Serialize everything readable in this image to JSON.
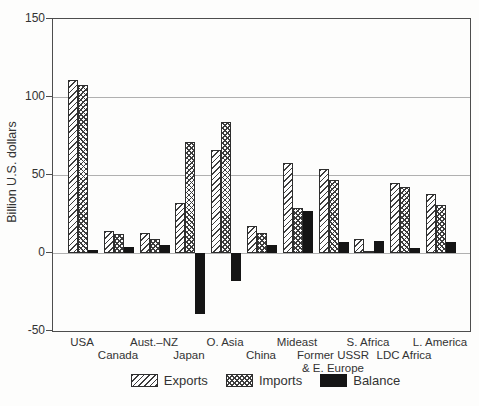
{
  "chart_data": {
    "type": "bar",
    "title": "",
    "ylabel": "Billion U.S. dollars",
    "xlabel": "",
    "ylim": [
      -50,
      150
    ],
    "yticks": [
      150,
      100,
      50,
      0,
      -50
    ],
    "gridline_values": [
      100,
      50,
      0
    ],
    "grid": "on",
    "legend_position": "bottom-center",
    "categories": [
      "USA",
      "Canada",
      "Aust.–NZ",
      "Japan",
      "O. Asia",
      "China",
      "Mideast",
      "Former USSR & E. Europe",
      "S. Africa",
      "LDC Africa",
      "L. America"
    ],
    "category_display": [
      {
        "lines": [
          "USA"
        ],
        "row": 1
      },
      {
        "lines": [
          "Canada"
        ],
        "row": 2
      },
      {
        "lines": [
          "Aust.–NZ"
        ],
        "row": 1
      },
      {
        "lines": [
          "Japan"
        ],
        "row": 2
      },
      {
        "lines": [
          "O. Asia"
        ],
        "row": 1
      },
      {
        "lines": [
          "China"
        ],
        "row": 2
      },
      {
        "lines": [
          "Mideast"
        ],
        "row": 1
      },
      {
        "lines": [
          "Former USSR",
          "& E. Europe"
        ],
        "row": 2
      },
      {
        "lines": [
          "S. Africa"
        ],
        "row": 1
      },
      {
        "lines": [
          "LDC Africa"
        ],
        "row": 2
      },
      {
        "lines": [
          "L. America"
        ],
        "row": 1
      }
    ],
    "series": [
      {
        "name": "Exports",
        "pattern": "diagonal-hatch",
        "values": [
          111,
          14,
          13,
          32,
          66,
          17,
          58,
          54,
          9,
          45,
          38
        ]
      },
      {
        "name": "Imports",
        "pattern": "crosshatch",
        "values": [
          108,
          12,
          9,
          71,
          84,
          13,
          29,
          47,
          1,
          42,
          31
        ]
      },
      {
        "name": "Balance",
        "pattern": "solid",
        "values": [
          2,
          4,
          5,
          -39,
          -18,
          5,
          27,
          7,
          8,
          3,
          7
        ]
      }
    ]
  },
  "colors": {
    "background": "#fdfdfc",
    "frame": "#4d4d4d",
    "gridline": "#b0b0b0",
    "hatch_line": "#3d3d3d",
    "bar_outline": "#2e2e2e",
    "solid_fill": "#151515",
    "text": "#333333"
  }
}
